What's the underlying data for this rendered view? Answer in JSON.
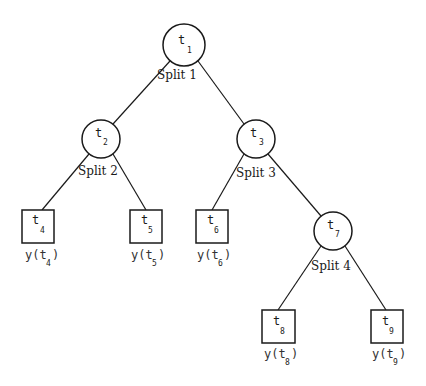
{
  "diagram": {
    "type": "binary classification/regression tree",
    "nodes": [
      {
        "id": "t1",
        "kind": "internal",
        "symbol": "t",
        "index": "1",
        "split_label": "Split 1",
        "cx": 184,
        "cy": 45,
        "r": 21
      },
      {
        "id": "t2",
        "kind": "internal",
        "symbol": "t",
        "index": "2",
        "split_label": "Split 2",
        "cx": 101,
        "cy": 139,
        "r": 19
      },
      {
        "id": "t3",
        "kind": "internal",
        "symbol": "t",
        "index": "3",
        "split_label": "Split 3",
        "cx": 256,
        "cy": 139,
        "r": 19
      },
      {
        "id": "t4",
        "kind": "terminal",
        "symbol": "t",
        "index": "4",
        "value_label": "y(t",
        "value_index": "4",
        "x": 22,
        "y": 210,
        "w": 32,
        "h": 33
      },
      {
        "id": "t5",
        "kind": "terminal",
        "symbol": "t",
        "index": "5",
        "value_label": "y(t",
        "value_index": "5",
        "x": 130,
        "y": 210,
        "w": 32,
        "h": 33
      },
      {
        "id": "t6",
        "kind": "terminal",
        "symbol": "t",
        "index": "6",
        "value_label": "y(t",
        "value_index": "6",
        "x": 196,
        "y": 210,
        "w": 32,
        "h": 33
      },
      {
        "id": "t7",
        "kind": "internal",
        "symbol": "t",
        "index": "7",
        "split_label": "Split 4",
        "cx": 333,
        "cy": 231,
        "r": 19
      },
      {
        "id": "t8",
        "kind": "terminal",
        "symbol": "t",
        "index": "8",
        "value_label": "y(t",
        "value_index": "8",
        "x": 262,
        "y": 310,
        "w": 33,
        "h": 33
      },
      {
        "id": "t9",
        "kind": "terminal",
        "symbol": "t",
        "index": "9",
        "value_label": "y(t",
        "value_index": "9",
        "x": 371,
        "y": 310,
        "w": 32,
        "h": 33
      }
    ],
    "edges": [
      {
        "from": "t1",
        "to": "t2"
      },
      {
        "from": "t1",
        "to": "t3"
      },
      {
        "from": "t2",
        "to": "t4"
      },
      {
        "from": "t2",
        "to": "t5"
      },
      {
        "from": "t3",
        "to": "t6"
      },
      {
        "from": "t3",
        "to": "t7"
      },
      {
        "from": "t7",
        "to": "t8"
      },
      {
        "from": "t7",
        "to": "t9"
      }
    ],
    "labels": {
      "split1": "Split 1",
      "split2": "Split 2",
      "split3": "Split 3",
      "split4": "Split 4",
      "t": "t",
      "y_open": "y(t",
      "close_paren": ")",
      "i1": "1",
      "i2": "2",
      "i3": "3",
      "i4": "4",
      "i5": "5",
      "i6": "6",
      "i7": "7",
      "i8": "8",
      "i9": "9"
    },
    "colors": {
      "stroke": "#1a1a1a",
      "background": "#ffffff"
    }
  }
}
